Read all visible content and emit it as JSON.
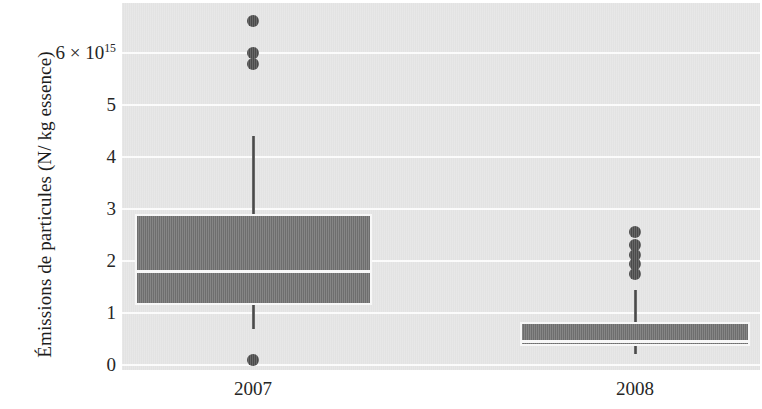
{
  "chart_data": {
    "type": "box",
    "title": "",
    "xlabel": "",
    "ylabel": "Émissions de particules (N/ kg essence)",
    "y_exponent_label": "6 × 10",
    "y_exponent_sup": "15",
    "ylim": [
      0,
      6.85
    ],
    "grid": true,
    "legend": "none",
    "yticks": [
      {
        "value": 6,
        "label": "6 × 10",
        "sup": "15"
      },
      {
        "value": 5,
        "label": "5",
        "sup": ""
      },
      {
        "value": 4,
        "label": "4",
        "sup": ""
      },
      {
        "value": 3,
        "label": "3",
        "sup": ""
      },
      {
        "value": 2,
        "label": "2",
        "sup": ""
      },
      {
        "value": 1,
        "label": "1",
        "sup": ""
      },
      {
        "value": 0,
        "label": "0",
        "sup": ""
      }
    ],
    "categories": [
      "2007",
      "2008"
    ],
    "boxes": [
      {
        "category": "2007",
        "whisker_low": 0.7,
        "q1": 1.15,
        "median": 1.8,
        "q3": 2.9,
        "whisker_high": 4.4,
        "outliers": [
          0.1,
          5.78,
          6.0,
          6.62
        ]
      },
      {
        "category": "2008",
        "whisker_low": 0.22,
        "q1": 0.36,
        "median": 0.47,
        "q3": 0.83,
        "whisker_high": 1.45,
        "outliers": [
          1.75,
          1.95,
          2.12,
          2.3,
          2.55
        ]
      }
    ],
    "colors": {
      "panel_background": "#e3e3e3",
      "gridline": "#fbfbfb",
      "box_fill": "#6e6e6e",
      "box_edge": "#f7f7f7",
      "median_line": "#f7f7f7",
      "whisker": "#4a4a4a",
      "outlier": "#4a4a4a",
      "text": "#262626"
    }
  }
}
